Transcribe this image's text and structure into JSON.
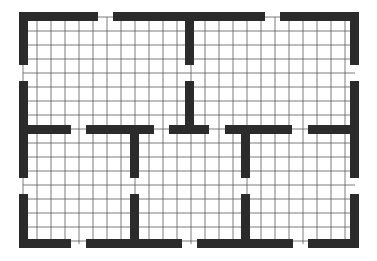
{
  "diagram": {
    "type": "floor-plan-grid",
    "colors": {
      "wall": "#2b2b2b",
      "grid": "#5a5a5a",
      "background": "#ffffff"
    },
    "grid": {
      "x0": 23,
      "y0": 17,
      "x1": 355,
      "y1": 244,
      "spacing": 14
    },
    "walls": [
      {
        "id": "top-left",
        "x": 19,
        "y": 12,
        "w": 79,
        "h": 9
      },
      {
        "id": "top-middle",
        "x": 113,
        "y": 12,
        "w": 152,
        "h": 9
      },
      {
        "id": "top-right",
        "x": 280,
        "y": 12,
        "w": 79,
        "h": 9
      },
      {
        "id": "top-center-stem",
        "x": 185,
        "y": 12,
        "w": 9,
        "h": 53
      },
      {
        "id": "left-upper",
        "x": 19,
        "y": 12,
        "w": 9,
        "h": 53
      },
      {
        "id": "left-middle",
        "x": 19,
        "y": 81,
        "w": 9,
        "h": 97
      },
      {
        "id": "left-lower",
        "x": 19,
        "y": 194,
        "w": 9,
        "h": 54
      },
      {
        "id": "right-upper",
        "x": 350,
        "y": 12,
        "w": 9,
        "h": 53
      },
      {
        "id": "right-middle",
        "x": 350,
        "y": 81,
        "w": 9,
        "h": 97
      },
      {
        "id": "right-lower",
        "x": 350,
        "y": 194,
        "w": 9,
        "h": 54
      },
      {
        "id": "mid-1",
        "x": 19,
        "y": 125,
        "w": 52,
        "h": 9
      },
      {
        "id": "mid-2",
        "x": 86,
        "y": 125,
        "w": 68,
        "h": 9
      },
      {
        "id": "mid-2-stem",
        "x": 130,
        "y": 125,
        "w": 9,
        "h": 53
      },
      {
        "id": "mid-3",
        "x": 169,
        "y": 125,
        "w": 40,
        "h": 9
      },
      {
        "id": "mid-3-stem",
        "x": 185,
        "y": 81,
        "w": 9,
        "h": 53
      },
      {
        "id": "mid-4",
        "x": 225,
        "y": 125,
        "w": 67,
        "h": 9
      },
      {
        "id": "mid-4-stem",
        "x": 241,
        "y": 125,
        "w": 9,
        "h": 53
      },
      {
        "id": "mid-5",
        "x": 308,
        "y": 125,
        "w": 51,
        "h": 9
      },
      {
        "id": "bottom-1",
        "x": 19,
        "y": 239,
        "w": 52,
        "h": 9
      },
      {
        "id": "bottom-2",
        "x": 86,
        "y": 239,
        "w": 96,
        "h": 9
      },
      {
        "id": "bottom-2-stem",
        "x": 130,
        "y": 194,
        "w": 9,
        "h": 54
      },
      {
        "id": "bottom-3",
        "x": 197,
        "y": 239,
        "w": 96,
        "h": 9
      },
      {
        "id": "bottom-3-stem",
        "x": 241,
        "y": 194,
        "w": 9,
        "h": 54
      },
      {
        "id": "bottom-4",
        "x": 308,
        "y": 239,
        "w": 51,
        "h": 9
      }
    ]
  }
}
